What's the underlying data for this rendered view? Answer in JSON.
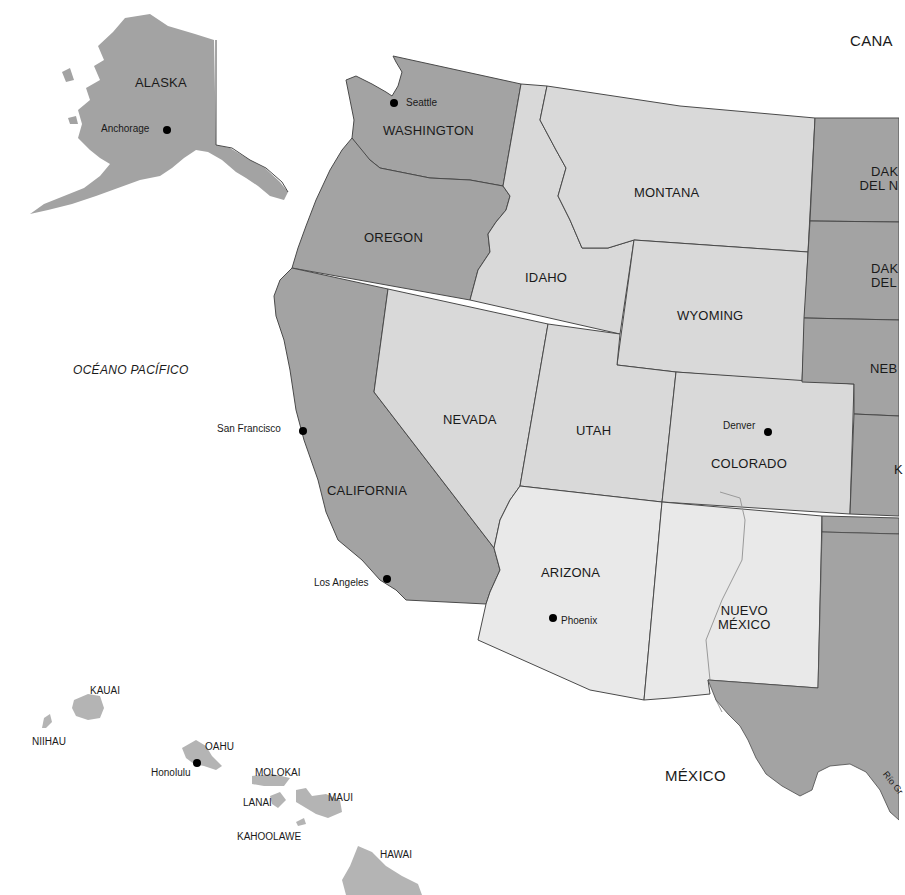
{
  "map": {
    "colors": {
      "background": "#ffffff",
      "dark_state": "#a3a3a3",
      "medium_state": "#d9d9d9",
      "light_state": "#e9e9e9",
      "island": "#b4b4b4",
      "border": "#4a4a4a",
      "river": "#9a9a9a",
      "text": "#1a1a1a",
      "city_dot": "#000000"
    },
    "regions": {
      "canada": "CANA",
      "mexico": "MÉXICO",
      "ocean": "OCÉANO PACÍFICO"
    },
    "states": {
      "alaska": "ALASKA",
      "washington": "WASHINGTON",
      "oregon": "OREGON",
      "california": "CALIFORNIA",
      "idaho": "IDAHO",
      "montana": "MONTANA",
      "wyoming": "WYOMING",
      "nevada": "NEVADA",
      "utah": "UTAH",
      "colorado": "COLORADO",
      "arizona": "ARIZONA",
      "new_mexico_line1": "NUEVO",
      "new_mexico_line2": "MÉXICO",
      "north_dakota_line1": "DAK",
      "north_dakota_line2": "DEL N",
      "south_dakota_line1": "DAK",
      "south_dakota_line2": "DEL",
      "nebraska": "NEB",
      "kansas": "K"
    },
    "cities": {
      "anchorage": "Anchorage",
      "seattle": "Seattle",
      "san_francisco": "San Francisco",
      "los_angeles": "Los Angeles",
      "denver": "Denver",
      "phoenix": "Phoenix",
      "honolulu": "Honolulu"
    },
    "islands": {
      "kauai": "KAUAI",
      "niihau": "NIIHAU",
      "oahu": "OAHU",
      "molokai": "MOLOKAI",
      "lanai": "LANAI",
      "maui": "MAUI",
      "kahoolawe": "KAHOOLAWE",
      "hawaii": "HAWAI"
    },
    "rivers": {
      "rio_grande": "Río Gr"
    }
  }
}
